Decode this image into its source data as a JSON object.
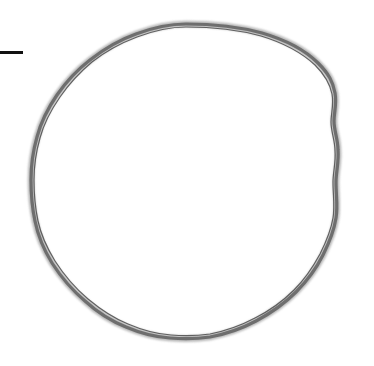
{
  "canvas": {
    "width": 374,
    "height": 366,
    "background_color": "#ffffff",
    "title": "Hand-drawn circle sketch"
  },
  "shapes": [
    {
      "name": "hand-drawn-circle",
      "type": "circle-outline",
      "style": "sketchy",
      "center_x": 185,
      "center_y": 181,
      "radius_x": 154,
      "radius_y": 157,
      "stroke_color": "#6e6e6e",
      "halo_color": "#9a9a9a",
      "stroke_width": 3.2,
      "halo_width": 6.5,
      "bounds": {
        "left": 31,
        "top": 24,
        "right": 339,
        "bottom": 338
      }
    },
    {
      "name": "horizontal-line-mark",
      "type": "line",
      "x1": 0,
      "y1": 52,
      "x2": 23,
      "y2": 52,
      "stroke_color": "#111111",
      "stroke_width": 3
    }
  ],
  "palette": {
    "background": "#ffffff",
    "circle_gray": "#6e6e6e",
    "circle_halo": "#9a9a9a",
    "line_black": "#111111"
  }
}
